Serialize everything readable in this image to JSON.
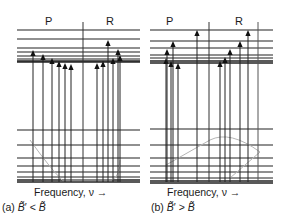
{
  "panels": [
    {
      "id": "a",
      "branch_labels": {
        "P": "P",
        "R": "R"
      },
      "axis_label": "Frequency, ν →",
      "caption": "(a) B̃′ < B̃",
      "condition": "B' < B",
      "upper_levels_y": [
        30,
        39,
        48,
        52,
        56,
        59,
        61,
        62
      ],
      "lower_levels_y": [
        130,
        145,
        158,
        166,
        172,
        177,
        180,
        182
      ],
      "P_branch_arrows": [
        {
          "x": 33,
          "tip_y": 51
        },
        {
          "x": 43,
          "tip_y": 55
        },
        {
          "x": 52,
          "tip_y": 59
        },
        {
          "x": 59,
          "tip_y": 62
        },
        {
          "x": 65,
          "tip_y": 64
        },
        {
          "x": 71,
          "tip_y": 65
        }
      ],
      "R_branch_arrows": [
        {
          "x": 97,
          "tip_y": 64
        },
        {
          "x": 103,
          "tip_y": 62
        },
        {
          "x": 108,
          "tip_y": 41
        },
        {
          "x": 113,
          "tip_y": 59
        },
        {
          "x": 118,
          "tip_y": 50
        },
        {
          "x": 120,
          "tip_y": 56
        }
      ]
    },
    {
      "id": "b",
      "branch_labels": {
        "P": "P",
        "R": "R"
      },
      "axis_label": "Frequency, ν →",
      "caption": "(b) B̃′ > B̃",
      "condition": "B' > B",
      "upper_levels_y": [
        30,
        41,
        48,
        55,
        58,
        61,
        63
      ],
      "lower_levels_y": [
        129,
        145,
        158,
        166,
        172,
        178,
        181,
        183
      ],
      "P_branch_arrows": [
        {
          "x": 166,
          "tip_y": 59
        },
        {
          "x": 167,
          "tip_y": 50
        },
        {
          "x": 171,
          "tip_y": 62
        },
        {
          "x": 173,
          "tip_y": 42
        },
        {
          "x": 178,
          "tip_y": 64
        },
        {
          "x": 197,
          "tip_y": 31
        }
      ],
      "R_branch_arrows": [
        {
          "x": 220,
          "tip_y": 62
        },
        {
          "x": 225,
          "tip_y": 58
        },
        {
          "x": 230,
          "tip_y": 50
        },
        {
          "x": 240,
          "tip_y": 42
        },
        {
          "x": 248,
          "tip_y": 31
        }
      ]
    }
  ]
}
